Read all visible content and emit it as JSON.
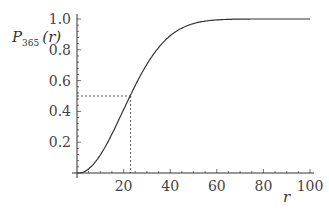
{
  "chart_data": {
    "type": "line",
    "title": "",
    "xlabel": "r",
    "ylabel": "P365(r)",
    "ylabel_main": "P",
    "ylabel_sub": "365",
    "ylabel_arg": "(r)",
    "xlim": [
      0,
      100
    ],
    "ylim": [
      0,
      1.0
    ],
    "x_ticks": [
      "20",
      "40",
      "60",
      "80",
      "100"
    ],
    "y_ticks": [
      "0.2",
      "0.4",
      "0.6",
      "0.8",
      "1.0"
    ],
    "grid": false,
    "legend": null,
    "series": [
      {
        "name": "P365(r)",
        "x": [
          0,
          5,
          10,
          15,
          20,
          23,
          25,
          30,
          35,
          40,
          45,
          50,
          55,
          60,
          70,
          80,
          90,
          100
        ],
        "values": [
          0,
          0.027,
          0.117,
          0.253,
          0.411,
          0.507,
          0.569,
          0.706,
          0.814,
          0.891,
          0.941,
          0.97,
          0.986,
          0.994,
          0.999,
          1.0,
          1.0,
          1.0
        ]
      }
    ],
    "annotations": [
      {
        "type": "dashed-guide",
        "x": 23,
        "y": 0.5,
        "description": "dashed lines from y-axis at 0.5 and x-axis at r=23 meeting on curve"
      }
    ]
  }
}
